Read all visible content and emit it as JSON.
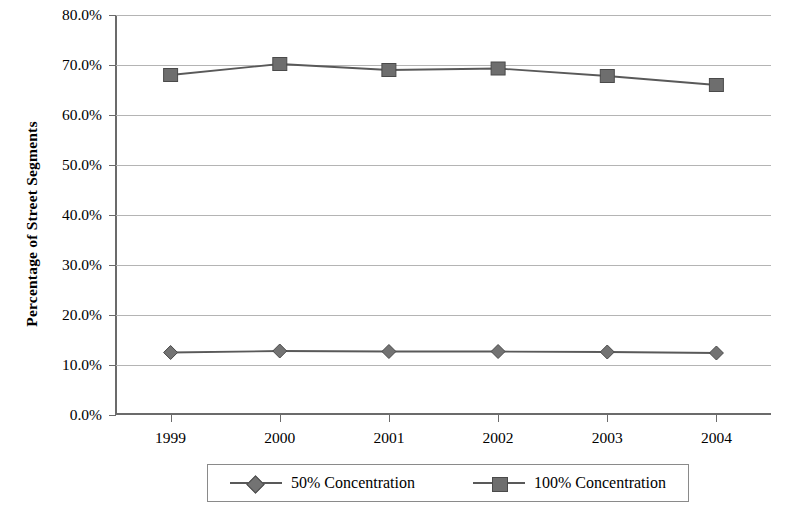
{
  "chart_data": {
    "type": "line",
    "title": "",
    "xlabel": "",
    "ylabel": "Percentage of Street Segments",
    "categories": [
      "1999",
      "2000",
      "2001",
      "2002",
      "2003",
      "2004"
    ],
    "ylim": [
      0,
      80
    ],
    "ytick_values": [
      0,
      10,
      20,
      30,
      40,
      50,
      60,
      70,
      80
    ],
    "ytick_labels": [
      "0.0%",
      "10.0%",
      "20.0%",
      "30.0%",
      "40.0%",
      "50.0%",
      "60.0%",
      "70.0%",
      "80.0%"
    ],
    "grid": true,
    "legend_position": "bottom",
    "series": [
      {
        "name": "50% Concentration",
        "marker": "diamond",
        "color": "#737373",
        "line_color": "#595959",
        "values": [
          12.5,
          12.8,
          12.7,
          12.7,
          12.6,
          12.4
        ]
      },
      {
        "name": "100% Concentration",
        "marker": "square",
        "color": "#6e6e6e",
        "line_color": "#595959",
        "values": [
          68.0,
          70.2,
          69.0,
          69.3,
          67.8,
          66.0
        ]
      }
    ]
  },
  "legend": {
    "items": [
      {
        "label": "50% Concentration",
        "marker": "diamond-marker"
      },
      {
        "label": "100% Concentration",
        "marker": "square-marker"
      }
    ]
  },
  "colors": {
    "gridline": "#b4b4b4",
    "axis": "#6b6b6b",
    "series_line": "#595959",
    "marker_fill": "#6e6e6e",
    "background": "#ffffff"
  }
}
